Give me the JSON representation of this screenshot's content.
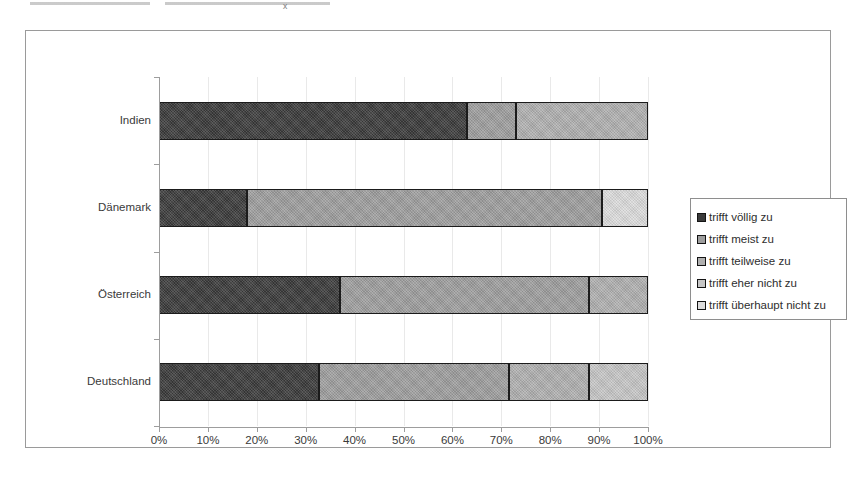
{
  "chart_data": {
    "type": "bar",
    "orientation": "horizontal",
    "stacked": true,
    "normalized": "100%",
    "title": "",
    "xlabel": "",
    "ylabel": "",
    "xlim": [
      0,
      100
    ],
    "grid": true,
    "legend_position": "right",
    "categories": [
      "Indien",
      "Dänemark",
      "Österreich",
      "Deutschland"
    ],
    "tick_labels": [
      "0%",
      "10%",
      "20%",
      "30%",
      "40%",
      "50%",
      "60%",
      "70%",
      "80%",
      "90%",
      "100%"
    ],
    "tick_values": [
      0,
      10,
      20,
      30,
      40,
      50,
      60,
      70,
      80,
      90,
      100
    ],
    "series": [
      {
        "name": "trifft völlig zu",
        "color": "#3a3a3a",
        "values": [
          63.0,
          18.0,
          37.0,
          32.7
        ]
      },
      {
        "name": "trifft meist zu",
        "color": "#9e9e9e",
        "values": [
          10.0,
          72.5,
          51.0,
          38.9
        ]
      },
      {
        "name": "trifft teilweise zu",
        "color": "#b0b0b0",
        "values": [
          27.0,
          0.0,
          12.0,
          16.4
        ]
      },
      {
        "name": "trifft eher nicht zu",
        "color": "#c6c6c6",
        "values": [
          0.0,
          0.0,
          0.0,
          12.0
        ]
      },
      {
        "name": "trifft überhaupt nicht zu",
        "color": "#dcdcdc",
        "values": [
          0.0,
          9.5,
          0.0,
          0.0
        ]
      }
    ]
  },
  "legend": {
    "items": [
      {
        "label": "trifft völlig zu"
      },
      {
        "label": "trifft meist zu"
      },
      {
        "label": "trifft teilweise zu"
      },
      {
        "label": "trifft eher nicht zu"
      },
      {
        "label": "trifft überhaupt nicht zu"
      }
    ]
  },
  "colors": {
    "frame_border": "#9a9a9a",
    "axis": "#9d9d9d",
    "gridline": "#e9e9e9",
    "segment_outline": "#1b1b1b",
    "text": "#3a3a3a",
    "background": "#ffffff"
  }
}
